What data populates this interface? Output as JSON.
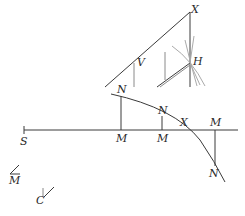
{
  "figure": {
    "type": "geometric-construction",
    "stroke_color": "#3a3a3a",
    "faint_color": "#9a9a9a",
    "labels": {
      "x_top": "X",
      "h": "H",
      "v": "V",
      "n1": "N",
      "n2": "N",
      "n3": "N",
      "m1": "M",
      "m2": "M",
      "m3": "M",
      "x_mid": "X",
      "s": "S",
      "m_small": "M",
      "c_small": "C"
    }
  }
}
